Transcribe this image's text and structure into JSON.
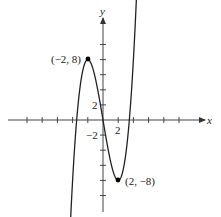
{
  "chart_data": {
    "type": "line",
    "title": "",
    "xlabel": "x",
    "ylabel": "y",
    "function": "f(x) = 0.5x^3 - 6x",
    "xlim": [
      -13,
      13.5
    ],
    "ylim": [
      -12,
      16
    ],
    "tick_step": 2,
    "x_ticks": [
      -10,
      -8,
      -6,
      -4,
      -2,
      0,
      2,
      4,
      6,
      8,
      10
    ],
    "y_ticks": [
      -10,
      -8,
      -6,
      -4,
      -2,
      0,
      2,
      4,
      6,
      8,
      10
    ],
    "tick_labels": {
      "x": [
        {
          "value": 2,
          "label": "2"
        }
      ],
      "y": [
        {
          "value": 2,
          "label": "2"
        },
        {
          "value": -2,
          "label": "-2"
        }
      ]
    },
    "grid": false,
    "legend": null,
    "series": [
      {
        "name": "curve",
        "x": [
          -4.4,
          -4,
          -3.46,
          -3,
          -2,
          -1,
          0,
          1,
          2,
          3,
          3.46,
          4,
          4.55
        ],
        "y": [
          -16.2,
          -8,
          0,
          4.5,
          8,
          5.5,
          0,
          -5.5,
          -8,
          -4.5,
          0,
          8,
          19.8
        ]
      }
    ],
    "annotations": [
      {
        "x": -2,
        "y": 8,
        "label": "(−2, 8)",
        "marker": "dot"
      },
      {
        "x": 2,
        "y": -8,
        "label": "(2, −8)",
        "marker": "dot"
      }
    ]
  },
  "labels": {
    "x_axis": "x",
    "y_axis": "y",
    "x_tick_2": "2",
    "y_tick_2": "2",
    "y_tick_neg2": "−2",
    "point_max": "(−2, 8)",
    "point_min": "(2, −8)"
  },
  "colors": {
    "axis": "#333333",
    "curve": "#222222",
    "point": "#000000"
  }
}
